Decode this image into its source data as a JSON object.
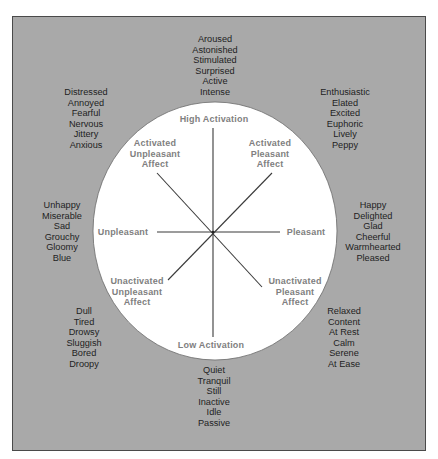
{
  "diagram": {
    "colors": {
      "background": "#a9a9a9",
      "circle_fill": "#ffffff",
      "axis_line": "#3a3a3a",
      "outer_text": "#1e1e1e",
      "inner_text": "#808080",
      "frame_border": "#4a4a4a"
    },
    "axes": {
      "top": "High Activation",
      "bottom": "Low Activation",
      "left": "Unpleasant",
      "right": "Pleasant"
    },
    "quadrants": {
      "activated_unpleasant": [
        "Activated",
        "Unpleasant",
        "Affect"
      ],
      "activated_pleasant": [
        "Activated",
        "Pleasant",
        "Affect"
      ],
      "unactivated_unpleasant": [
        "Unactivated",
        "Unpleasant",
        "Affect"
      ],
      "unactivated_pleasant": [
        "Unactivated",
        "Pleasant",
        "Affect"
      ]
    },
    "clusters": {
      "high_activation": [
        "Aroused",
        "Astonished",
        "Stimulated",
        "Surprised",
        "Active",
        "Intense"
      ],
      "activated_unpleasant": [
        "Distressed",
        "Annoyed",
        "Fearful",
        "Nervous",
        "Jittery",
        "Anxious"
      ],
      "activated_pleasant": [
        "Enthusiastic",
        "Elated",
        "Excited",
        "Euphoric",
        "Lively",
        "Peppy"
      ],
      "unpleasant": [
        "Unhappy",
        "Miserable",
        "Sad",
        "Grouchy",
        "Gloomy",
        "Blue"
      ],
      "pleasant": [
        "Happy",
        "Delighted",
        "Glad",
        "Cheerful",
        "Warmhearted",
        "Pleased"
      ],
      "unactivated_unpleasant": [
        "Dull",
        "Tired",
        "Drowsy",
        "Sluggish",
        "Bored",
        "Droopy"
      ],
      "unactivated_pleasant": [
        "Relaxed",
        "Content",
        "At Rest",
        "Calm",
        "Serene",
        "At Ease"
      ],
      "low_activation": [
        "Quiet",
        "Tranquil",
        "Still",
        "Inactive",
        "Idle",
        "Passive"
      ]
    }
  }
}
